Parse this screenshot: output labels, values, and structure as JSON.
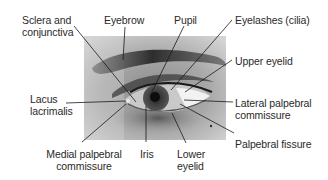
{
  "diagram": {
    "labels": [
      {
        "id": "sclera",
        "lines": [
          "Sclera and",
          "conjunctiva"
        ]
      },
      {
        "id": "eyebrow",
        "lines": [
          "Eyebrow"
        ]
      },
      {
        "id": "pupil",
        "lines": [
          "Pupil"
        ]
      },
      {
        "id": "eyelashes",
        "lines": [
          "Eyelashes (cilia)"
        ]
      },
      {
        "id": "upper-eyelid",
        "lines": [
          "Upper eyelid"
        ]
      },
      {
        "id": "lacus",
        "lines": [
          "Lacus",
          "lacrimalis"
        ]
      },
      {
        "id": "lateral-commissure",
        "lines": [
          "Lateral palpebral",
          "commissure"
        ]
      },
      {
        "id": "palpebral-fissure",
        "lines": [
          "Palpebral fissure"
        ]
      },
      {
        "id": "medial-commissure",
        "lines": [
          "Medial palpebral",
          "commissure"
        ]
      },
      {
        "id": "iris",
        "lines": [
          "Iris"
        ]
      },
      {
        "id": "lower-eyelid",
        "lines": [
          "Lower",
          "eyelid"
        ]
      }
    ],
    "colors": {
      "text": "#2a2a2a",
      "leader": "#1a1a1a",
      "background": "#ffffff"
    }
  }
}
